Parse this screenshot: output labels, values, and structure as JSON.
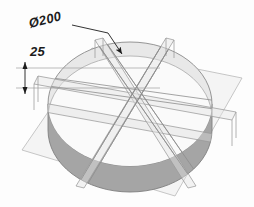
{
  "drawing": {
    "type": "isometric-cad-view",
    "title_visible": false,
    "background_color": "#fdfdfd",
    "line_color": "#8e8e8e",
    "dim_text_color": "#1c1c1c"
  },
  "annotations": {
    "diameter": {
      "label": "Ø200",
      "value": 200,
      "symbol": "diameter",
      "leader": "points to top rim of disc"
    },
    "thickness": {
      "label": "25",
      "value": 25,
      "dimension_type": "linear-vertical",
      "measures": "disc thickness"
    }
  },
  "geometry": {
    "solid": "cylindrical disc",
    "top_face_color": "#e6e6e6",
    "rim_color": "#a2a2a2",
    "back_crescent_color": "#cfcfcf",
    "ground_plane_color": "#f1f1f1",
    "ground_plane_edge": "#b8b8b8",
    "section_planes_count": 3,
    "section_band_color": "#ededed"
  }
}
